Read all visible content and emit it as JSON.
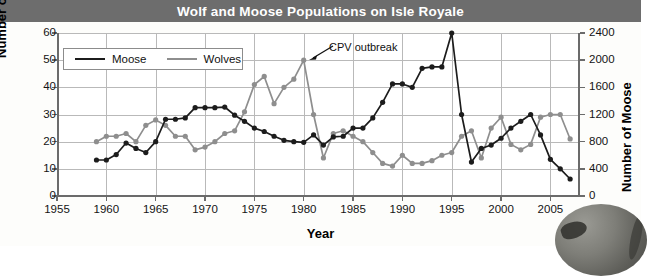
{
  "header": {
    "title": "Wolf and  Moose Populations on Isle Royale",
    "bar_color": "#6d6d6d",
    "text_color": "#ffffff"
  },
  "legend": {
    "moose_label": "Moose",
    "wolves_label": "Wolves",
    "moose_color": "#1c1c1c",
    "wolves_color": "#8e8e8e"
  },
  "annotation": {
    "text": "CPV outbreak",
    "points_to_year": 1980,
    "points_to_value": 50
  },
  "chart_data": {
    "type": "line",
    "title": "Wolf and  Moose Populations on Isle Royale",
    "xlabel": "Year",
    "ylabel": "Number of Wolves",
    "y2label": "Number of Moose",
    "xlim": [
      1955,
      2008
    ],
    "ylim": [
      0,
      60
    ],
    "y2lim": [
      0,
      2400
    ],
    "xticks": [
      1955,
      1960,
      1965,
      1970,
      1975,
      1980,
      1985,
      1990,
      1995,
      2000,
      2005
    ],
    "yticks": [
      0,
      10,
      20,
      30,
      40,
      50,
      60
    ],
    "y2ticks": [
      0,
      400,
      800,
      1200,
      1600,
      2000,
      2400
    ],
    "grid": true,
    "legend_position": "upper-left-inside",
    "series": [
      {
        "name": "Wolves",
        "axis": "left",
        "units": "wolves",
        "color": "#8e8e8e",
        "x": [
          1959,
          1960,
          1961,
          1962,
          1963,
          1964,
          1965,
          1966,
          1967,
          1968,
          1969,
          1970,
          1971,
          1972,
          1973,
          1974,
          1975,
          1976,
          1977,
          1978,
          1979,
          1980,
          1981,
          1982,
          1983,
          1984,
          1985,
          1986,
          1987,
          1988,
          1989,
          1990,
          1991,
          1992,
          1993,
          1994,
          1995,
          1996,
          1997,
          1998,
          1999,
          2000,
          2001,
          2002,
          2003,
          2004,
          2005,
          2006,
          2007
        ],
        "y": [
          20,
          22,
          22,
          23,
          20,
          26,
          28,
          26,
          22,
          22,
          17,
          18,
          20,
          23,
          24,
          31,
          41,
          44,
          34,
          40,
          43,
          50,
          30,
          14,
          23,
          24,
          22,
          20,
          16,
          12,
          11,
          15,
          12,
          12,
          13,
          15,
          16,
          22,
          24,
          14,
          25,
          29,
          19,
          17,
          19,
          29,
          30,
          30,
          21
        ]
      },
      {
        "name": "Moose",
        "axis": "right",
        "units": "moose",
        "color": "#1c1c1c",
        "x": [
          1959,
          1960,
          1961,
          1962,
          1963,
          1964,
          1965,
          1966,
          1967,
          1968,
          1969,
          1970,
          1971,
          1972,
          1973,
          1974,
          1975,
          1976,
          1977,
          1978,
          1979,
          1980,
          1981,
          1982,
          1983,
          1984,
          1985,
          1986,
          1987,
          1988,
          1989,
          1990,
          1991,
          1992,
          1993,
          1994,
          1995,
          1996,
          1997,
          1998,
          1999,
          2000,
          2001,
          2002,
          2003,
          2004,
          2005,
          2006,
          2007
        ],
        "y": [
          530,
          530,
          610,
          780,
          700,
          640,
          800,
          1130,
          1130,
          1150,
          1300,
          1300,
          1300,
          1310,
          1190,
          1100,
          1000,
          950,
          880,
          820,
          800,
          790,
          900,
          750,
          870,
          880,
          1000,
          1000,
          1150,
          1380,
          1650,
          1650,
          1600,
          1880,
          1900,
          1900,
          2400,
          1200,
          500,
          700,
          750,
          850,
          1000,
          1100,
          1200,
          900,
          540,
          400,
          250
        ]
      }
    ]
  }
}
